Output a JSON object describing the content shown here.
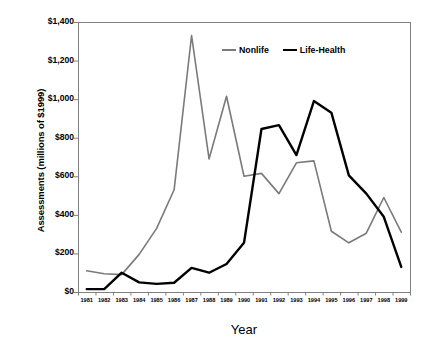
{
  "chart_data": {
    "type": "line",
    "title": "",
    "xlabel": "Year",
    "ylabel": "Assessments (millions of $1999)",
    "categories": [
      "1981",
      "1982",
      "1983",
      "1984",
      "1985",
      "1986",
      "1987",
      "1988",
      "1989",
      "1990",
      "1991",
      "1992",
      "1993",
      "1994",
      "1995",
      "1996",
      "1997",
      "1998",
      "1999"
    ],
    "ylim": [
      0,
      1400
    ],
    "ytick_values": [
      0,
      200,
      400,
      600,
      800,
      1000,
      1200,
      1400
    ],
    "ytick_labels": [
      "$0",
      "$200",
      "$400",
      "$600",
      "$800",
      "$1,000",
      "$1,200",
      "$1,400"
    ],
    "grid": false,
    "legend_position": "top-right-inside",
    "series": [
      {
        "name": "Nonlife",
        "color": "#7a7a7a",
        "values": [
          110,
          95,
          90,
          195,
          330,
          530,
          1330,
          690,
          1015,
          600,
          615,
          510,
          670,
          680,
          315,
          255,
          305,
          490,
          310
        ]
      },
      {
        "name": "Life-Health",
        "color": "#000000",
        "values": [
          15,
          15,
          100,
          50,
          42,
          48,
          125,
          100,
          145,
          255,
          845,
          865,
          710,
          990,
          930,
          605,
          510,
          390,
          130
        ]
      }
    ]
  }
}
